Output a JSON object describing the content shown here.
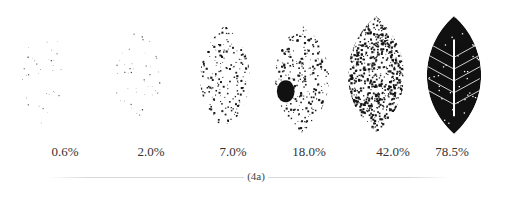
{
  "figure": {
    "caption": "(4a)",
    "panels": [
      {
        "label": "0.6%",
        "severity": 0.006,
        "cx": 42,
        "cy": 72,
        "w": 60,
        "h": 110,
        "label_x": 65,
        "mode": "dots"
      },
      {
        "label": "2.0%",
        "severity": 0.02,
        "cx": 138,
        "cy": 75,
        "w": 68,
        "h": 90,
        "label_x": 151,
        "mode": "dots"
      },
      {
        "label": "7.0%",
        "severity": 0.07,
        "cx": 225,
        "cy": 78,
        "w": 68,
        "h": 105,
        "label_x": 233,
        "mode": "spots"
      },
      {
        "label": "18.0%",
        "severity": 0.18,
        "cx": 302,
        "cy": 78,
        "w": 74,
        "h": 110,
        "label_x": 309,
        "mode": "spots"
      },
      {
        "label": "42.0%",
        "severity": 0.42,
        "cx": 376,
        "cy": 75,
        "w": 76,
        "h": 118,
        "label_x": 393,
        "mode": "dense"
      },
      {
        "label": "78.5%",
        "severity": 0.785,
        "cx": 454,
        "cy": 75,
        "w": 74,
        "h": 118,
        "label_x": 452,
        "mode": "solid"
      }
    ],
    "colors": {
      "spot": "#111111",
      "text": "#333333",
      "rule": "#d8d8d8"
    }
  }
}
